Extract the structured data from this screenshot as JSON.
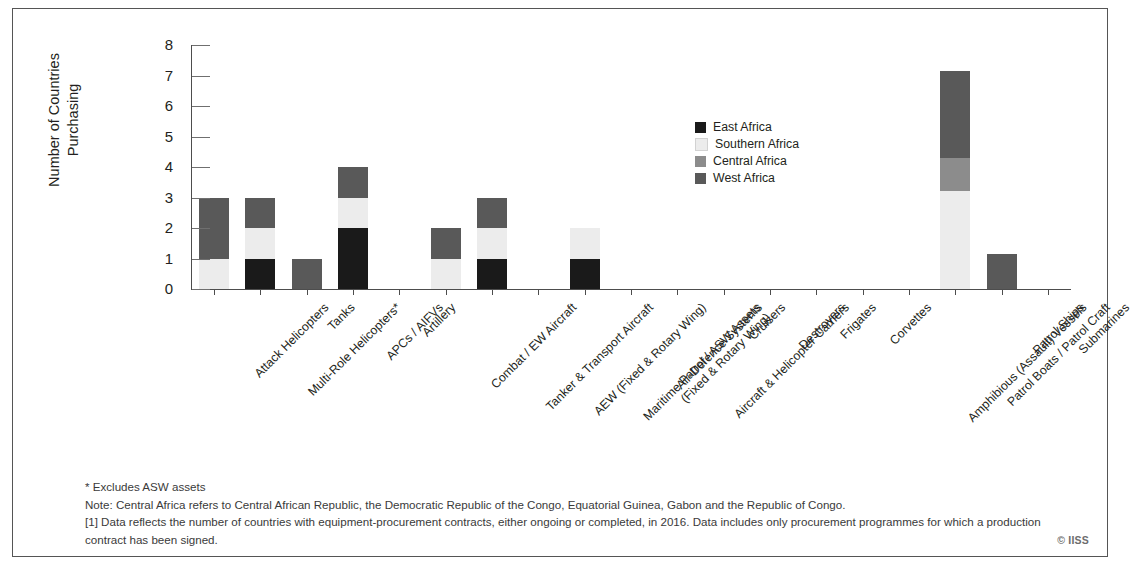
{
  "chart_data": {
    "type": "bar",
    "stacked": true,
    "title": "",
    "xlabel": "",
    "ylabel": "Number of Countries\nPurchasing",
    "ylim": [
      0,
      8
    ],
    "yticks": [
      0,
      1,
      2,
      3,
      4,
      5,
      6,
      7,
      8
    ],
    "grid": false,
    "legend_position": "inside-upper-right",
    "categories": [
      "Attack Helicopters",
      "Multi-Role Helicopters*",
      "Tanks",
      "APCs / AIFVs",
      "Artillery",
      "Combat / EW Aircraft",
      "Tanker & Transport Aircraft",
      "AEW (Fixed & Rotary Wing)",
      "Maritime Patrol / ASW Assets\n(Fixed & Rotary Wing)",
      "Air-Defence Systems",
      "Aircraft & Helicopter Carriers",
      "Cruisers",
      "Destroyers",
      "Frigates",
      "Corvettes",
      "Amphibious (Assault) Vessels",
      "Patrol Boats / Patrol Craft",
      "Patrol Ships",
      "Submarines"
    ],
    "series": [
      {
        "name": "East Africa",
        "color": "#1a1a1a",
        "values": [
          0,
          1,
          0,
          2,
          0,
          0,
          1,
          0,
          1,
          0,
          0,
          0,
          0,
          0,
          0,
          0,
          0,
          0,
          0
        ]
      },
      {
        "name": "Southern Africa",
        "color": "#ececec",
        "values": [
          1,
          1,
          0,
          1,
          0,
          1,
          1,
          0,
          1,
          0,
          0,
          0,
          0,
          0,
          0,
          0,
          3.2,
          0,
          0
        ]
      },
      {
        "name": "Central Africa",
        "color": "#8c8c8c",
        "values": [
          0,
          0,
          0,
          0,
          0,
          0,
          0,
          0,
          0,
          0,
          0,
          0,
          0,
          0,
          0,
          0,
          1.1,
          0,
          0
        ]
      },
      {
        "name": "West Africa",
        "color": "#595959",
        "values": [
          2,
          1,
          1,
          1,
          0,
          1,
          1,
          0,
          0,
          0,
          0,
          0,
          0,
          0,
          0,
          0,
          2.85,
          1.15,
          0
        ]
      }
    ],
    "totals": [
      3,
      3,
      1,
      4,
      0,
      2,
      3,
      0,
      2,
      0,
      0,
      0,
      0,
      0,
      0,
      0,
      7.15,
      1.15,
      0
    ]
  },
  "legend": {
    "items": [
      {
        "label": "East Africa",
        "color": "#1a1a1a"
      },
      {
        "label": "Southern Africa",
        "color": "#ececec"
      },
      {
        "label": "Central Africa",
        "color": "#8c8c8c"
      },
      {
        "label": "West Africa",
        "color": "#595959"
      }
    ]
  },
  "footnotes": {
    "line1": "* Excludes ASW assets",
    "line2": "Note: Central Africa refers to Central African Republic, the Democratic Republic of the Congo, Equatorial Guinea, Gabon and the Republic of Congo.",
    "line3": "[1] Data reflects the number of countries with equipment-procurement contracts, either ongoing or completed, in 2016. Data includes only procurement programmes for which a production contract has been signed."
  },
  "copyright": "© IISS"
}
